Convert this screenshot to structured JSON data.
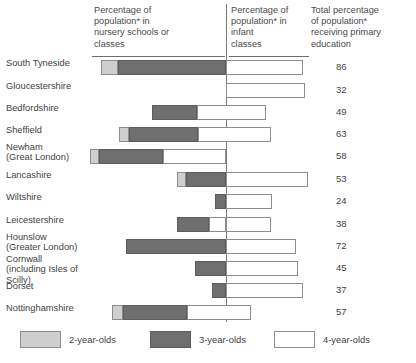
{
  "header": {
    "nursery": "Percentage of\npopulation* in\nnursery schools or\nclasses",
    "infant": "Percentage of\npopulation* in\ninfant\nclasses",
    "total": "Total percentage\nof population*\nreceiving primary\neducation"
  },
  "legend": {
    "items": [
      {
        "label": "2-year-olds",
        "key": "two",
        "color": "#cfcfcf"
      },
      {
        "label": "3-year-olds",
        "key": "three",
        "color": "#6f6f6f"
      },
      {
        "label": "4-year-olds",
        "key": "four",
        "color": "#ffffff"
      }
    ]
  },
  "chart_data": {
    "type": "bar",
    "orientation": "horizontal",
    "subtype": "diverging-stacked",
    "title": "",
    "xlabel": "",
    "ylabel": "",
    "grid": false,
    "legend_position": "bottom",
    "axis_note": "Vertical baseline separates nursery schools/classes (left) from infant classes (right).",
    "series": [
      {
        "name": "2-year-olds",
        "color": "#cfcfcf"
      },
      {
        "name": "3-year-olds",
        "color": "#6f6f6f"
      },
      {
        "name": "4-year-olds",
        "color": "#ffffff"
      }
    ],
    "categories": [
      "South Tyneside",
      "Gloucestershire",
      "Bedfordshire",
      "Sheffield",
      "Newham\n(Great London)",
      "Lancashire",
      "Wiltshire",
      "Leicestershire",
      "Hounslow\n(Greater London)",
      "Cornwall\n(including Isles of Scilly)",
      "Dorset",
      "Nottinghamshire"
    ],
    "totals": [
      86,
      32,
      49,
      63,
      58,
      53,
      24,
      38,
      72,
      45,
      37,
      57
    ],
    "rows": [
      {
        "category": "South Tyneside",
        "total": 86,
        "segments": [
          {
            "series": "2-year-olds",
            "start": 101,
            "end": 118
          },
          {
            "series": "3-year-olds",
            "start": 118,
            "end": 226
          },
          {
            "series": "4-year-olds",
            "start": 226,
            "end": 303
          }
        ]
      },
      {
        "category": "Gloucestershire",
        "total": 32,
        "segments": [
          {
            "series": "4-year-olds",
            "start": 226,
            "end": 305
          }
        ]
      },
      {
        "category": "Bedfordshire",
        "total": 49,
        "segments": [
          {
            "series": "3-year-olds",
            "start": 152,
            "end": 197
          },
          {
            "series": "4-year-olds",
            "start": 197,
            "end": 266
          }
        ]
      },
      {
        "category": "Sheffield",
        "total": 63,
        "segments": [
          {
            "series": "2-year-olds",
            "start": 119,
            "end": 129
          },
          {
            "series": "3-year-olds",
            "start": 129,
            "end": 198
          },
          {
            "series": "4-year-olds",
            "start": 198,
            "end": 271
          }
        ]
      },
      {
        "category": "Newham\n(Great London)",
        "total": 58,
        "segments": [
          {
            "series": "2-year-olds",
            "start": 90,
            "end": 99
          },
          {
            "series": "3-year-olds",
            "start": 99,
            "end": 163
          },
          {
            "series": "4-year-olds",
            "start": 163,
            "end": 226
          }
        ]
      },
      {
        "category": "Lancashire",
        "total": 53,
        "segments": [
          {
            "series": "2-year-olds",
            "start": 177,
            "end": 186
          },
          {
            "series": "3-year-olds",
            "start": 186,
            "end": 226
          },
          {
            "series": "4-year-olds",
            "start": 226,
            "end": 308
          }
        ]
      },
      {
        "category": "Wiltshire",
        "total": 24,
        "segments": [
          {
            "series": "3-year-olds",
            "start": 215,
            "end": 226
          },
          {
            "series": "4-year-olds",
            "start": 226,
            "end": 272
          }
        ]
      },
      {
        "category": "Leicestershire",
        "total": 38,
        "segments": [
          {
            "series": "3-year-olds",
            "start": 177,
            "end": 209
          },
          {
            "series": "4-year-olds",
            "start": 209,
            "end": 226
          },
          {
            "series": "4-year-olds",
            "start": 226,
            "end": 271
          }
        ]
      },
      {
        "category": "Hounslow\n(Greater London)",
        "total": 72,
        "segments": [
          {
            "series": "3-year-olds",
            "start": 126,
            "end": 226
          },
          {
            "series": "4-year-olds",
            "start": 226,
            "end": 296
          }
        ]
      },
      {
        "category": "Cornwall\n(including Isles of Scilly)",
        "total": 45,
        "segments": [
          {
            "series": "3-year-olds",
            "start": 195,
            "end": 226
          },
          {
            "series": "4-year-olds",
            "start": 226,
            "end": 298
          }
        ]
      },
      {
        "category": "Dorset",
        "total": 37,
        "segments": [
          {
            "series": "3-year-olds",
            "start": 212,
            "end": 226
          },
          {
            "series": "4-year-olds",
            "start": 226,
            "end": 303
          }
        ]
      },
      {
        "category": "Nottinghamshire",
        "total": 57,
        "segments": [
          {
            "series": "2-year-olds",
            "start": 112,
            "end": 123
          },
          {
            "series": "3-year-olds",
            "start": 123,
            "end": 187
          },
          {
            "series": "4-year-olds",
            "start": 187,
            "end": 251
          }
        ]
      }
    ]
  }
}
